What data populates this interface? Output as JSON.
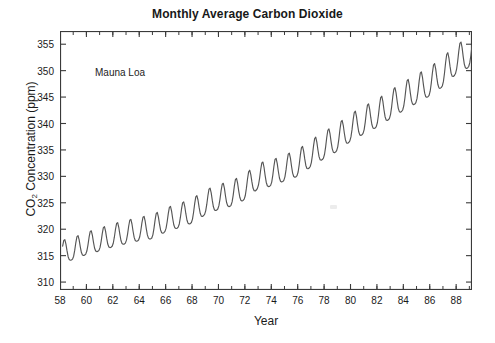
{
  "figure": {
    "title": "Monthly Average Carbon Dioxide",
    "annotation": "Mauna Loa",
    "x_axis_title": "Year",
    "y_axis_title_main": "CO",
    "y_axis_title_sub": "2",
    "y_axis_title_rest": " Concentration (ppm)",
    "line_color": "#555555",
    "axis_color": "#3a3a3a",
    "text_color": "#1a1a1a",
    "background": "#ffffff"
  },
  "chart_data": {
    "type": "line",
    "title": "Monthly Average Carbon Dioxide",
    "subtitle": "Mauna Loa",
    "xlabel": "Year",
    "ylabel": "CO2 Concentration (ppm)",
    "xlim": [
      1958.0,
      1989.2
    ],
    "ylim": [
      308.5,
      357.5
    ],
    "xticks": [
      58,
      60,
      62,
      64,
      66,
      68,
      70,
      72,
      74,
      76,
      78,
      80,
      82,
      84,
      86,
      88
    ],
    "xtick_labels": [
      "58",
      "60",
      "62",
      "64",
      "66",
      "68",
      "70",
      "72",
      "74",
      "76",
      "78",
      "80",
      "82",
      "84",
      "86",
      "88"
    ],
    "yticks": [
      310,
      315,
      320,
      325,
      330,
      335,
      340,
      345,
      350,
      355
    ],
    "ytick_labels": [
      "310",
      "315",
      "320",
      "325",
      "330",
      "335",
      "340",
      "345",
      "350",
      "355"
    ],
    "x_minor_tick_step": 1,
    "grid": false,
    "legend": false,
    "legend_position": "none",
    "series_name": "Mauna Loa monthly mean CO2",
    "annual_trend_ppm": {
      "1958": 315.3,
      "1959": 315.9,
      "1960": 316.9,
      "1961": 317.6,
      "1962": 318.4,
      "1963": 319.0,
      "1964": 319.6,
      "1965": 320.0,
      "1966": 321.3,
      "1967": 322.1,
      "1968": 323.0,
      "1969": 324.6,
      "1970": 325.6,
      "1971": 326.3,
      "1972": 327.5,
      "1973": 329.6,
      "1974": 330.1,
      "1975": 331.1,
      "1976": 332.0,
      "1977": 333.8,
      "1978": 335.4,
      "1979": 336.8,
      "1980": 338.7,
      "1981": 340.1,
      "1982": 341.4,
      "1983": 343.0,
      "1984": 344.6,
      "1985": 346.0,
      "1986": 347.4,
      "1987": 349.2,
      "1988": 351.6,
      "1989": 352.9
    },
    "seasonal_amplitude_ppm": 6.0,
    "seasonal_peak_month": 5,
    "seasonal_trough_month": 10,
    "x_start": 1958.2,
    "x_end": 1989.2,
    "y_start": 316.0,
    "y_end": 352.0,
    "y_min_observed": 312.6,
    "y_max_observed": 353.6
  }
}
